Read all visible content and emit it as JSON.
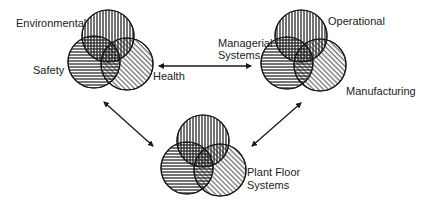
{
  "diagram": {
    "type": "venn-network",
    "colors": {
      "stroke": "#1a1a1a",
      "text": "#222222",
      "background": "#ffffff"
    },
    "hatch_legend": {
      "top_circle": "vertical-lines",
      "left_circle": "horizontal-lines",
      "right_circle": "diagonal-lines"
    },
    "nodes": [
      {
        "id": "left-venn",
        "labels": {
          "top": "Environmental",
          "left": "Safety",
          "right": "Health"
        }
      },
      {
        "id": "right-venn",
        "labels": {
          "top": "Operational",
          "center": "Managerial\nSystems",
          "right": "Manufacturing"
        }
      },
      {
        "id": "bottom-venn",
        "labels": {
          "right": "Plant Floor\nSystems"
        }
      }
    ],
    "connections": [
      {
        "from": "left-venn",
        "to": "right-venn",
        "type": "bidirectional-arrow"
      },
      {
        "from": "left-venn",
        "to": "bottom-venn",
        "type": "bidirectional-arrow"
      },
      {
        "from": "right-venn",
        "to": "bottom-venn",
        "type": "bidirectional-arrow"
      }
    ]
  },
  "labels": {
    "environmental": "Environmental",
    "safety": "Safety",
    "health": "Health",
    "managerial_line1": "Managerial",
    "managerial_line2": "Systems",
    "operational": "Operational",
    "manufacturing": "Manufacturing",
    "plant_floor_line1": "Plant Floor",
    "plant_floor_line2": "Systems"
  }
}
